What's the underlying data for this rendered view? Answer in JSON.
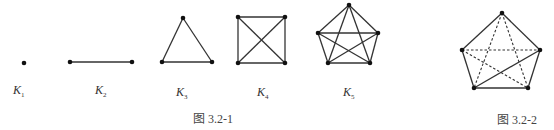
{
  "figure_1": {
    "caption": "图 3.2-1",
    "graphs": [
      {
        "name": "K",
        "sub": "1",
        "vertices": [
          [
            24,
            63
          ]
        ],
        "edges": []
      },
      {
        "name": "K",
        "sub": "2",
        "vertices": [
          [
            70,
            62
          ],
          [
            132,
            62
          ]
        ],
        "edges": [
          [
            0,
            1
          ]
        ]
      },
      {
        "name": "K",
        "sub": "3",
        "vertices": [
          [
            183,
            18
          ],
          [
            162,
            62
          ],
          [
            212,
            62
          ]
        ],
        "edges": [
          [
            0,
            1
          ],
          [
            1,
            2
          ],
          [
            2,
            0
          ]
        ]
      },
      {
        "name": "K",
        "sub": "4",
        "vertices": [
          [
            238,
            17
          ],
          [
            285,
            17
          ],
          [
            285,
            63
          ],
          [
            238,
            63
          ]
        ],
        "edges": [
          [
            0,
            1
          ],
          [
            1,
            2
          ],
          [
            2,
            3
          ],
          [
            3,
            0
          ],
          [
            0,
            2
          ],
          [
            1,
            3
          ]
        ]
      },
      {
        "name": "K",
        "sub": "5",
        "vertices": [
          [
            349,
            5
          ],
          [
            378,
            33
          ],
          [
            370,
            63
          ],
          [
            328,
            63
          ],
          [
            318,
            33
          ]
        ],
        "edges": [
          [
            0,
            1
          ],
          [
            1,
            2
          ],
          [
            2,
            3
          ],
          [
            3,
            4
          ],
          [
            4,
            0
          ],
          [
            0,
            2
          ],
          [
            0,
            3
          ],
          [
            1,
            3
          ],
          [
            1,
            4
          ],
          [
            2,
            4
          ]
        ]
      }
    ]
  },
  "figure_2": {
    "caption": "图 3.2-2",
    "vertices": [
      [
        502,
        13
      ],
      [
        540,
        50
      ],
      [
        528,
        88
      ],
      [
        474,
        88
      ],
      [
        462,
        50
      ]
    ],
    "solid_edges": [
      [
        0,
        1
      ],
      [
        1,
        2
      ],
      [
        2,
        3
      ],
      [
        3,
        4
      ],
      [
        4,
        0
      ],
      [
        3,
        1
      ]
    ],
    "dashed_edges": [
      [
        4,
        1
      ],
      [
        0,
        3
      ],
      [
        0,
        2
      ],
      [
        4,
        2
      ]
    ]
  }
}
